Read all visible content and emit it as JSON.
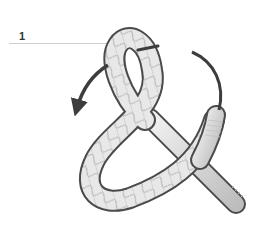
{
  "diagram": {
    "step_number": "1",
    "colors": {
      "rope_fill": "#e6e6e6",
      "rope_outline": "#4a4a4a",
      "rope_pattern": "#9a9a9a",
      "arrow": "#3d3d3d",
      "guide_line": "#cfcfcf"
    },
    "elements": [
      "step-label",
      "guide-line",
      "rope-loop",
      "rope-working-end",
      "rope-standing-end",
      "arrow-counterclockwise",
      "arrow-arc-right"
    ]
  }
}
